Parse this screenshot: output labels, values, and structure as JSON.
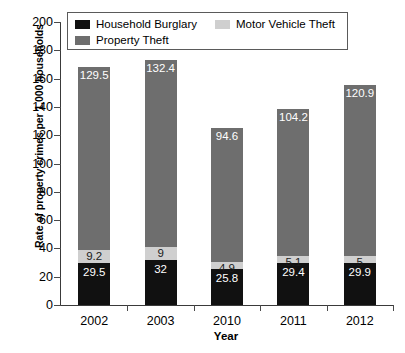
{
  "chart_data": {
    "type": "bar",
    "subtype": "stacked-vertical",
    "title": "",
    "xlabel": "Year",
    "ylabel": "Rate of property crimes per 1,000 households",
    "categories": [
      "2002",
      "2003",
      "2010",
      "2011",
      "2012"
    ],
    "ylim": [
      0,
      200
    ],
    "ytick_step": 20,
    "yticks": [
      "0",
      "20",
      "40",
      "60",
      "80",
      "100",
      "120",
      "140",
      "160",
      "180",
      "200"
    ],
    "grid": false,
    "legend_position": "top-inside",
    "series": [
      {
        "name": "Household Burglary",
        "color": "#111111",
        "values": [
          29.5,
          32,
          25.8,
          29.4,
          29.9
        ],
        "labels": [
          "29.5",
          "32",
          "25.8",
          "29.4",
          "29.9"
        ]
      },
      {
        "name": "Motor Vehicle Theft",
        "color": "#cfcfcf",
        "values": [
          9.2,
          9,
          4.9,
          5.1,
          5
        ],
        "labels": [
          "9.2",
          "9",
          "4.9",
          "5.1",
          "5"
        ]
      },
      {
        "name": "Property Theft",
        "color": "#6e6e6e",
        "values": [
          129.5,
          132.4,
          94.6,
          104.2,
          120.9
        ],
        "labels": [
          "129.5",
          "132.4",
          "94.6",
          "104.2",
          "120.9"
        ]
      }
    ],
    "totals": [
      168.2,
      173.4,
      125.3,
      138.7,
      155.8
    ]
  },
  "legend": {
    "entries": [
      {
        "label": "Household Burglary"
      },
      {
        "label": "Motor Vehicle Theft"
      },
      {
        "label": "Property Theft"
      }
    ]
  }
}
